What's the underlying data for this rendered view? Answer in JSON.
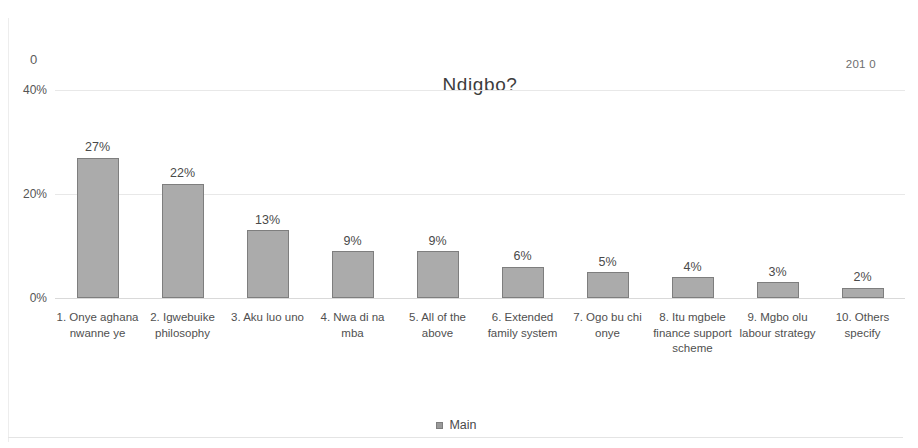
{
  "page": {
    "header_left": "0",
    "header_right": "201 0"
  },
  "legend": {
    "entries": [
      {
        "label": "Main",
        "color": "#ababab"
      }
    ]
  },
  "chart_data": {
    "type": "bar",
    "title": "Ndigbo?",
    "xlabel": "",
    "ylabel": "",
    "ylim": [
      0,
      40
    ],
    "yticks": [
      "0%",
      "20%",
      "40%"
    ],
    "grid": true,
    "legend_position": "bottom",
    "value_labels": [
      "27%",
      "22%",
      "13%",
      "9%",
      "9%",
      "6%",
      "5%",
      "4%",
      "3%",
      "2%"
    ],
    "categories": [
      "1. Onye aghana nwanne ye",
      "2. Igwebuike philosophy",
      "3. Aku luo uno",
      "4. Nwa di na mba",
      "5. All of the above",
      "6. Extended family system",
      "7. Ogo bu chi onye",
      "8. Itu mgbele finance support scheme",
      "9. Mgbo olu labour strategy",
      "10. Others specify"
    ],
    "series": [
      {
        "name": "Main",
        "values": [
          27,
          22,
          13,
          9,
          9,
          6,
          5,
          4,
          3,
          2
        ]
      }
    ]
  }
}
